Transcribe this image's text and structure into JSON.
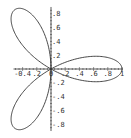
{
  "chart_data": {
    "type": "line",
    "title": "",
    "subtitle": "",
    "xlabel": "",
    "ylabel": "",
    "equation": "r = cos(3θ)",
    "xlim": [
      -0.5,
      1.0
    ],
    "ylim": [
      -0.87,
      0.87
    ],
    "grid": false,
    "legend": null,
    "x_ticks": [
      -0.4,
      -0.2,
      0,
      0.2,
      0.4,
      0.6,
      0.8,
      1
    ],
    "y_ticks": [
      -0.8,
      -0.6,
      -0.4,
      -0.2,
      0.2,
      0.4,
      0.6,
      0.8
    ],
    "x_tick_labels": [
      "-0.4",
      "0.2",
      "0",
      "0.2",
      "0.4",
      "0.6",
      "0.8",
      "1"
    ],
    "y_tick_labels": [
      "-0.8",
      "-0.6",
      "-0.4",
      "-0.2",
      "0.2",
      "0.4",
      "0.6",
      "0.8"
    ],
    "petals": [
      {
        "name": "right",
        "tip": [
          1.0,
          0.0
        ]
      },
      {
        "name": "upper-left",
        "tip": [
          -0.5,
          0.866
        ]
      },
      {
        "name": "lower-left",
        "tip": [
          -0.5,
          -0.866
        ]
      }
    ],
    "series": [
      {
        "name": "rose",
        "color": "#333333",
        "samples": 360
      }
    ]
  },
  "colors": {
    "curve": "#333333",
    "axes": "#333333",
    "background": "#ffffff"
  }
}
